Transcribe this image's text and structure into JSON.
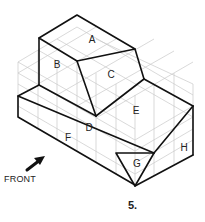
{
  "figure": {
    "number": "5.",
    "front_label": "FRONT",
    "front_arrow_icon": "front-direction-arrow-icon",
    "face_labels": [
      "A",
      "B",
      "C",
      "D",
      "E",
      "F",
      "G",
      "H"
    ],
    "colors": {
      "edge": "#111111",
      "grid": "#c8c8c8",
      "background": "#ffffff"
    }
  }
}
